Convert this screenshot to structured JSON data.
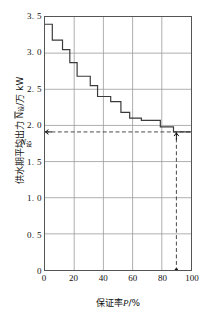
{
  "chart_data": {
    "type": "line",
    "subtype": "step-post",
    "title": "",
    "xlabel": "保证率P/%",
    "ylabel": "供水期平均出力 N设/万 kW",
    "ylabel_parts": {
      "prefix": "供水期平均出力 ",
      "overbar_symbol": "N",
      "subscript": "设",
      "suffix": "/万 kW"
    },
    "xlabel_parts": {
      "prefix": "保证率",
      "symbol": "P",
      "suffix": "/%"
    },
    "xlim": [
      0,
      100
    ],
    "ylim": [
      0,
      3.5
    ],
    "xticks": [
      0,
      20,
      40,
      60,
      80,
      100
    ],
    "xtick_labels": [
      "0",
      "20",
      "40",
      "60",
      "80",
      "100"
    ],
    "yticks": [
      0,
      0.5,
      1.0,
      1.5,
      2.0,
      2.5,
      3.0,
      3.5
    ],
    "ytick_labels": [
      "0",
      "0. 5",
      "1. 0",
      "1. 5",
      "2. 0",
      "2. 5",
      "3. 0",
      "3. 5"
    ],
    "grid": true,
    "grid_color": "#9a9a9a",
    "curve_color": "#3a3a3a",
    "legend": null,
    "x": [
      0,
      4,
      7,
      11,
      14,
      18,
      22,
      27,
      31,
      35,
      40,
      44,
      48,
      53,
      57,
      62,
      66,
      71,
      75,
      79,
      84,
      88,
      92,
      100
    ],
    "y": [
      3.4,
      3.4,
      3.18,
      3.18,
      3.05,
      3.05,
      2.87,
      2.87,
      2.68,
      2.68,
      2.55,
      2.55,
      2.4,
      2.4,
      2.33,
      2.33,
      2.18,
      2.18,
      2.1,
      2.1,
      2.07,
      2.07,
      1.98,
      1.98
    ],
    "step_levels": [
      3.4,
      3.18,
      3.05,
      2.87,
      2.68,
      2.55,
      2.4,
      2.33,
      2.18,
      2.1,
      2.07,
      1.98,
      1.91
    ],
    "step_edges": [
      0,
      5,
      12,
      17,
      22,
      31,
      36,
      45,
      52,
      58,
      66,
      79,
      88,
      100
    ],
    "annotations": [
      {
        "name": "n-design",
        "label": "N设",
        "type": "horizontal-dashed-line",
        "y": 1.91,
        "arrow": "left-at-axis"
      },
      {
        "name": "p-design",
        "label": "P设",
        "type": "vertical-dashed-line",
        "x": 90,
        "arrow": "up-at-curve",
        "dot_at_axis": true
      }
    ]
  },
  "markers": {
    "n_design": {
      "symbol": "N",
      "subscript": "设"
    },
    "p_design": {
      "symbol": "P",
      "subscript": "设"
    }
  }
}
